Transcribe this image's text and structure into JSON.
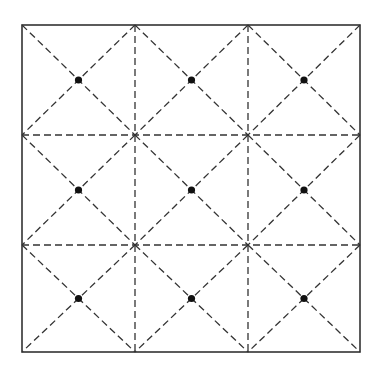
{
  "diagram": {
    "type": "square grid with diagonal fold lines",
    "grid": {
      "rows": 3,
      "cols": 3
    },
    "outer_square": {
      "x1": 22,
      "y1": 25,
      "x2": 360,
      "y2": 352
    },
    "grid_lines_x": [
      135,
      248
    ],
    "grid_lines_y": [
      135,
      245
    ],
    "dot_count": 9,
    "colors": {
      "line": "#333333",
      "dot": "#111111",
      "background": "#ffffff"
    }
  }
}
